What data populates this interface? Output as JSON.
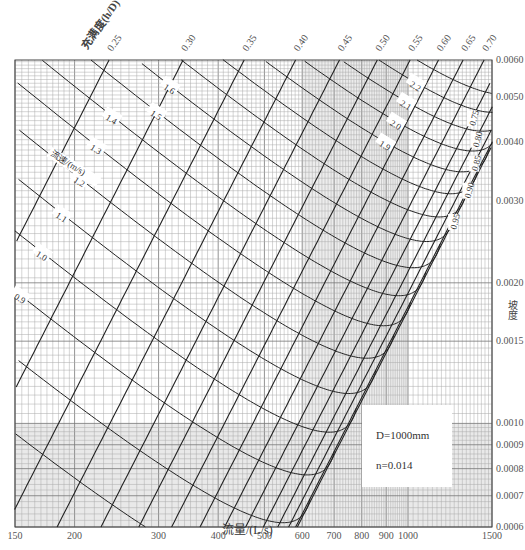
{
  "chart_data": {
    "type": "nomogram",
    "title": "",
    "pipe": {
      "diameter_label": "D=1000mm",
      "roughness_label": "n=0.014",
      "diameter_m": 1.0,
      "n": 0.014
    },
    "xlabel": "流量/(L/s)",
    "ylabel": "坡度",
    "x_scale": "log",
    "y_scale": "log",
    "xlim": [
      150,
      1500
    ],
    "ylim": [
      0.0006,
      0.006
    ],
    "x_ticks": [
      150,
      200,
      300,
      400,
      500,
      600,
      700,
      800,
      900,
      1000,
      1500
    ],
    "y_ticks": [
      0.0006,
      0.0007,
      0.0008,
      0.0009,
      0.001,
      0.0015,
      0.002,
      0.003,
      0.004,
      0.005,
      0.006
    ],
    "y_tick_labels": [
      "0.0006",
      "0.0007",
      "0.0008",
      "0.0009",
      "0.0010",
      "0.0015",
      "0.0020",
      "0.0030",
      "0.0040",
      "0.0050",
      "0.0060"
    ],
    "depth_ratio_label": "充满度(h/D)",
    "depth_ratio_curves": [
      0.25,
      0.3,
      0.35,
      0.4,
      0.45,
      0.5,
      0.55,
      0.6,
      0.65,
      0.7,
      0.75,
      0.8,
      0.85,
      0.9,
      0.95
    ],
    "depth_ratio_top_labels": [
      "0.25",
      "0.30",
      "0.35",
      "0.40",
      "0.45",
      "0.50",
      "0.55",
      "0.60",
      "0.65",
      "0.70"
    ],
    "depth_ratio_side_labels": [
      "0.75",
      "0.80",
      "0.85",
      "0.90",
      "0.95"
    ],
    "velocity_label": "流速/(m/s)",
    "velocity_curves": [
      0.7,
      0.8,
      0.9,
      1.0,
      1.1,
      1.2,
      1.3,
      1.4,
      1.5,
      1.6,
      1.7,
      1.8,
      1.9,
      2.0,
      2.1,
      2.2,
      2.3
    ],
    "velocity_labels": [
      "0.7",
      "0.8",
      "0.9",
      "1.0",
      "1.1",
      "1.2",
      "1.3",
      "1.4",
      "1.5",
      "1.6",
      "1.7",
      "1.8",
      "1.9",
      "2.0",
      "2.1",
      "2.2",
      "2.3"
    ],
    "grid": true,
    "legend_position": "lower-right"
  },
  "axes": {
    "x_title": "流量/(L/s)",
    "y_title": "坡度"
  },
  "legend": {
    "diameter": "D=1000mm",
    "roughness": "n=0.014"
  }
}
